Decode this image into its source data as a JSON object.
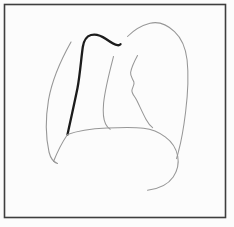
{
  "figure": {
    "canvas": {
      "width": 234,
      "height": 227
    },
    "background_color": "#fcfcfc",
    "frame": {
      "x": 4.5,
      "y": 4.5,
      "width": 221,
      "height": 213,
      "stroke": "#3e3e3e",
      "stroke_width": 1.6
    },
    "line_colors": {
      "thin_gray": "#979797",
      "highlight_black": "#1c1c1c"
    },
    "strokes": [
      {
        "name": "left-chest-wall-line",
        "color": "#979797",
        "width": 1.1,
        "d": "M 71 42 C 62 58 52 80 48.5 100 C 45.5 118 45.5 136 49 152 C 50.5 158 53 162 57.5 163.5"
      },
      {
        "name": "highlighted-pleural-line",
        "color": "#1c1c1c",
        "width": 2.3,
        "d": "M 67.5 134.5 C 71 118 74.5 103 77.5 88 C 80 74.5 81.2 58 82.8 47 C 83.7 41 86.2 36.4 91 35 C 96 33.6 101 35.5 106 39 C 110 41.8 114 44.6 117.5 45.2 C 118.7 45.4 119.7 45.1 120.5 44.2"
      },
      {
        "name": "right-paratracheal-heart-border-line",
        "color": "#979797",
        "width": 1.05,
        "d": "M 113.5 56.5 C 110 70 105.2 88 103.6 103 C 102.8 112 103.1 119 105.6 124 C 106.7 126.3 108.2 128.1 110.2 129.2"
      },
      {
        "name": "aortic-knob-mediastinal-line",
        "color": "#979797",
        "width": 1.05,
        "d": "M 137.5 55.5 C 134 62 131.5 67 130.6 72.5 C 130.1 76 132.6 78.6 133.9 82 C 134.9 84.8 132.1 87.5 131.9 90.5 C 131.7 93.5 134.6 96.2 136.6 100 C 139.6 106 142.6 113 146.1 119.5 C 148.1 123.2 150.1 125.7 152.6 127.6"
      },
      {
        "name": "diaphragm-heart-contour",
        "color": "#979797",
        "width": 1.05,
        "d": "M 53.5 161.5 C 57.5 151.5 62 142.5 67.5 134.5 C 78 130.5 92 128.7 107 128 C 120 127.4 133.5 127 143.5 128.2 C 150.5 129 158.5 131.8 165.2 136.8 C 171.6 141.5 176.2 148.2 177.7 156 C 179 163 177.7 170.3 173.2 177 C 168 184.6 159 188.9 147.5 190.2"
      },
      {
        "name": "right-chest-wall-line",
        "color": "#979797",
        "width": 1.05,
        "d": "M 127.5 36.5 C 133 31 141 25.6 150 23.3 C 158 21.3 167 24.6 174.5 31.6 C 181 37.6 185.6 47 187.1 60 C 188.6 74 187.7 95 185.6 112 C 184 125 181.6 140 178.6 151 C 177.9 154 177.1 156.6 176.6 158.6"
      }
    ]
  }
}
